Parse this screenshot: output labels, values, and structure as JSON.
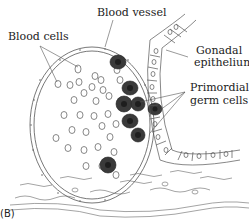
{
  "figure": {
    "panel_label": "(B)",
    "labels": {
      "blood_vessel": "Blood vessel",
      "blood_cells": "Blood cells",
      "gonadal_epithelium_line1": "Gonadal",
      "gonadal_epithelium_line2": "epithelium",
      "primordial_germ_cells_line1": "Primordial",
      "primordial_germ_cells_line2": "germ cells"
    },
    "colors": {
      "line": "#555555",
      "germ_cell_fill": "#3a3a3a",
      "germ_cell_nucleus": "#1e1e1e",
      "background": "#ffffff"
    }
  }
}
